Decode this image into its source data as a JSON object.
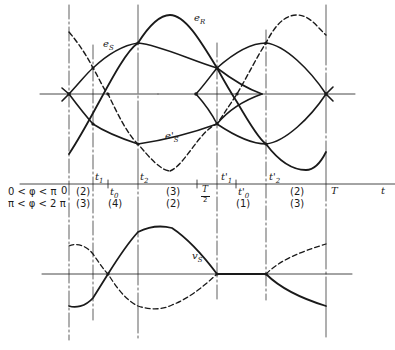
{
  "diagram": {
    "curve_labels": {
      "e_R": {
        "base": "e",
        "sub": "R"
      },
      "e_S": {
        "base": "e",
        "sub": "S"
      },
      "e_S_prime": {
        "base": "e'",
        "sub": "S"
      },
      "v_S": {
        "base": "v",
        "sub": "S"
      }
    },
    "time_axis": {
      "label": "t",
      "zero": "0",
      "ticks": [
        {
          "base": "t",
          "sub": "1"
        },
        {
          "base": "t",
          "sub": "0"
        },
        {
          "base": "t",
          "sub": "2"
        },
        {
          "base": "t'",
          "sub": "1"
        },
        {
          "base": "t'",
          "sub": "0"
        },
        {
          "base": "t'",
          "sub": "2"
        }
      ],
      "half_period_num": "T",
      "half_period_den": "2",
      "period": "T"
    },
    "conditions": [
      {
        "label": "0 < φ < π",
        "regions": [
          "(2)",
          "(4)",
          "(3)",
          "(1)",
          "(2)"
        ]
      },
      {
        "label": "π < φ < 2 π",
        "regions": [
          "(3)",
          "(4)",
          "(2)",
          "(1)",
          "(3)"
        ]
      }
    ],
    "region_row1": [
      "(2)",
      "t0",
      "(3)",
      "(1)",
      "(2)"
    ],
    "regions": {
      "r1_a": "(2)",
      "r2_a": "(3)",
      "r_mid_2": "(4)",
      "r1_b": "(3)",
      "r2_b": "(2)",
      "r_mid_4": "(1)",
      "r1_c": "(2)",
      "r2_c": "(3)"
    }
  }
}
